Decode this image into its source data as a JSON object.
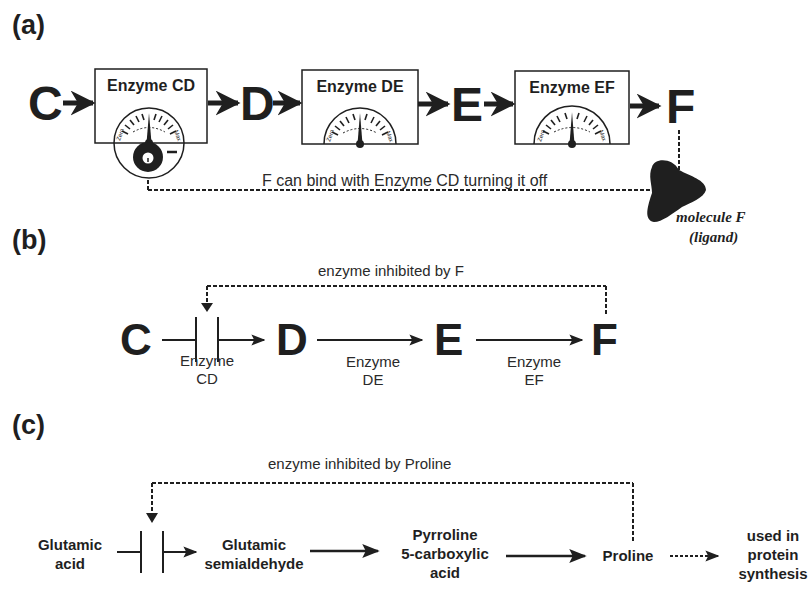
{
  "panels": {
    "a": {
      "label": "(a)",
      "chain": [
        "C",
        "D",
        "E",
        "F"
      ],
      "enzymes": [
        {
          "name": "Enzyme CD",
          "gauge_left": "Zero",
          "gauge_right": "Max"
        },
        {
          "name": "Enzyme DE",
          "gauge_left": "Zero",
          "gauge_right": "Max"
        },
        {
          "name": "Enzyme EF",
          "gauge_left": "Zero",
          "gauge_right": "Max"
        }
      ],
      "inhibitor_sign": "–",
      "feedback_caption": "F can bind with Enzyme CD turning it off",
      "ligand_label_line1": "molecule F",
      "ligand_label_line2": "(ligand)"
    },
    "b": {
      "label": "(b)",
      "chain": [
        "C",
        "D",
        "E",
        "F"
      ],
      "feedback_caption": "enzyme inhibited by F",
      "enzymes": [
        {
          "line1": "Enzyme",
          "line2": "CD"
        },
        {
          "line1": "Enzyme",
          "line2": "DE"
        },
        {
          "line1": "Enzyme",
          "line2": "EF"
        }
      ]
    },
    "c": {
      "label": "(c)",
      "feedback_caption": "enzyme inhibited by Proline",
      "nodes": [
        {
          "line1": "Glutamic",
          "line2": "acid"
        },
        {
          "line1": "Glutamic",
          "line2": "semialdehyde"
        },
        {
          "line1": "Pyrroline",
          "line2": "5-carboxylic",
          "line3": "acid"
        },
        {
          "line1": "Proline"
        },
        {
          "line1": "used in",
          "line2": "protein",
          "line3": "synthesis"
        }
      ]
    }
  },
  "colors": {
    "ink": "#1f1f1f",
    "background": "#ffffff"
  }
}
